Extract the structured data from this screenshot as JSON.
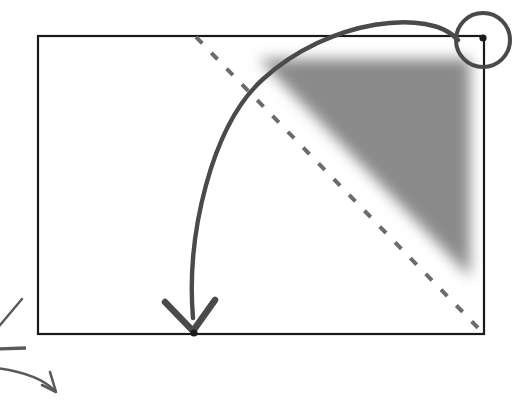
{
  "canvas": {
    "width": 528,
    "height": 401,
    "background": "#ffffff"
  },
  "figure": {
    "type": "geometric-diagram",
    "description": "Rectangle with a shaded triangular wedge in the upper-right, a dashed diagonal, a circled corner vertex, and a curved arrow sweeping from the circled corner down to a point on the bottom edge."
  },
  "style": {
    "outline_color": "#1a1a1a",
    "arrow_color": "#4a4a4a",
    "dashed_color": "#6b6b6b",
    "shade_color": "#8a8a8a",
    "point_color": "#1a1a1a",
    "outline_width": 2.2,
    "arrow_width": 4.2,
    "dashed_width": 4.0,
    "circle_width": 4.0
  },
  "rectangle": {
    "label": "bounding-rectangle",
    "x": 38,
    "y": 36,
    "width": 446,
    "height": 298,
    "corners": {
      "top_left": [
        38,
        36
      ],
      "top_right": [
        484,
        36
      ],
      "bottom_right": [
        484,
        334
      ],
      "bottom_left": [
        38,
        334
      ]
    }
  },
  "shaded_region": {
    "label": "shaded-wedge",
    "shape": "triangle",
    "fill": "#8a8a8a",
    "blur": 7,
    "vertices": [
      [
        259,
        59
      ],
      [
        470,
        59
      ],
      [
        470,
        277
      ]
    ]
  },
  "dashed_diagonal": {
    "label": "dashed-diagonal",
    "from": [
      196,
      37
    ],
    "to": [
      483,
      333
    ],
    "dash_pattern": "9 13"
  },
  "highlight_circle": {
    "label": "corner-highlight-circle",
    "center": [
      483,
      40
    ],
    "radius": 27
  },
  "points": [
    {
      "name": "corner-point-top-right",
      "x": 483,
      "y": 38,
      "radius": 3.6
    },
    {
      "name": "target-point-bottom",
      "x": 194,
      "y": 333,
      "radius": 3.6
    }
  ],
  "curved_arrow": {
    "label": "main-motion-arrow",
    "path": "M 458 40 C 430 8, 330 18, 262 80 C 212 126, 186 234, 193 318",
    "arrowhead": {
      "tip": [
        193,
        331
      ],
      "left_wing": [
        165,
        302
      ],
      "right_wing": [
        215,
        300
      ]
    }
  },
  "margin_marks": [
    {
      "name": "margin-tick-diagonal",
      "type": "line",
      "from": [
        -4,
        330
      ],
      "to": [
        22,
        299
      ]
    },
    {
      "name": "margin-tick-dash",
      "type": "line",
      "from": [
        -4,
        349
      ],
      "to": [
        26,
        348
      ]
    },
    {
      "name": "margin-curved-arrow",
      "type": "curve",
      "path": "M -12 367 C 18 370, 42 378, 54 390",
      "arrowhead": {
        "tip": [
          56,
          392
        ],
        "left_wing": [
          42,
          385
        ],
        "right_wing": [
          50,
          372
        ]
      }
    }
  ]
}
